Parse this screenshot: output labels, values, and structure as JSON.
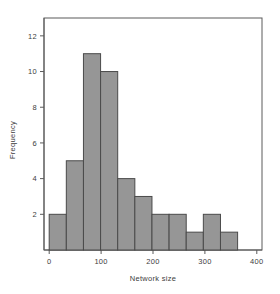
{
  "chart_data": {
    "type": "bar",
    "title": "",
    "subtitle": "",
    "xlabel": "Network size",
    "ylabel": "Frequency",
    "xlim": [
      -10,
      410
    ],
    "ylim": [
      0,
      13
    ],
    "xticks": [
      0,
      100,
      200,
      300,
      400
    ],
    "xtick_labels": [
      "0",
      "100",
      "200",
      "300",
      "400"
    ],
    "yticks": [
      2,
      4,
      6,
      8,
      10,
      12
    ],
    "ytick_labels": [
      "2",
      "4",
      "6",
      "8",
      "10",
      "12"
    ],
    "grid": false,
    "legend": false,
    "legend_position": "none",
    "bin_width": 33,
    "bin_edges": [
      0,
      33,
      66,
      99,
      132,
      165,
      198,
      231,
      264,
      297,
      330,
      363
    ],
    "categories": [
      "0-33",
      "33-66",
      "66-99",
      "99-132",
      "132-165",
      "165-198",
      "198-231",
      "231-264",
      "264-297",
      "297-330",
      "330-363"
    ],
    "values": [
      2,
      5,
      11,
      10,
      4,
      3,
      2,
      2,
      1,
      2,
      1
    ],
    "bar_fill_color": "#969696",
    "bar_edge_color": "#4a4a4a",
    "axis_color": "#5a5a5a",
    "text_color": "#3d3d3d",
    "background_color": "#ffffff"
  },
  "axes": {
    "x_title": "Network size",
    "y_title": "Frequency"
  }
}
